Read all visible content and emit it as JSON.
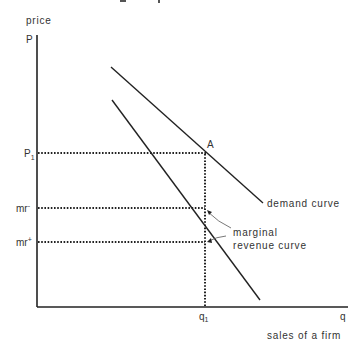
{
  "header": {
    "cropped_title_fragment": "... g ... p"
  },
  "axes": {
    "y_axis_title": "price",
    "y_axis_symbol": "P",
    "x_axis_symbol": "q",
    "x_axis_title": "sales of a firm"
  },
  "labels": {
    "p1": "P",
    "p1_sub": "1",
    "mr_minus": "mr",
    "mr_minus_sup": "-",
    "mr_plus": "mr",
    "mr_plus_sup": "+",
    "q1": "q",
    "q1_sub": "1",
    "point_a": "A",
    "demand_curve": "demand curve",
    "mr_curve_line1": "marginal",
    "mr_curve_line2": "revenue curve"
  },
  "colors": {
    "line": "#222222",
    "text": "#333333",
    "background": "#ffffff"
  },
  "geometry": {
    "origin": [
      37,
      307
    ],
    "y_axis_top": [
      37,
      35
    ],
    "x_axis_end": [
      348,
      307
    ],
    "demand_curve": [
      [
        111,
        67
      ],
      [
        263,
        203
      ]
    ],
    "mr_curve": [
      [
        112,
        100
      ],
      [
        260,
        300
      ]
    ],
    "p1_y": 153,
    "mr_minus_y": 208,
    "mr_plus_y": 242,
    "q1_x": 205
  }
}
